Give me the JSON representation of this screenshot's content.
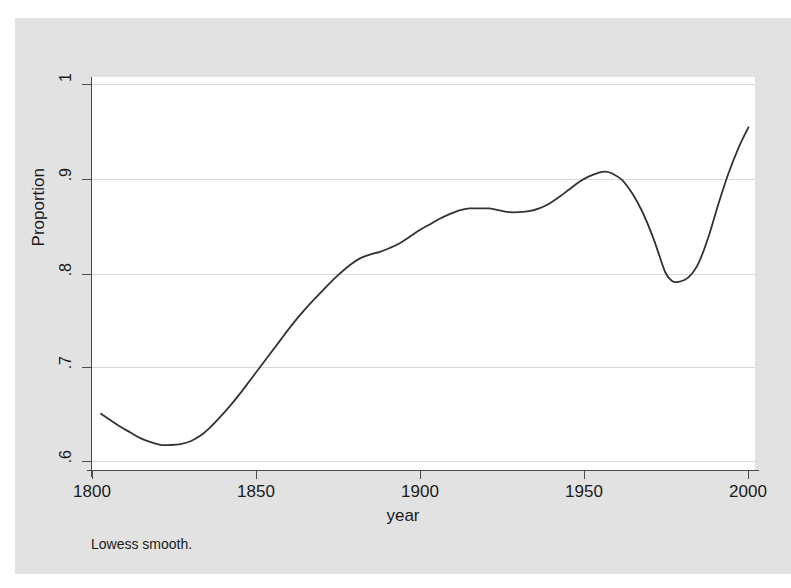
{
  "figure": {
    "background_color": "#e2e2e2",
    "plot_background_color": "#ffffff",
    "line_color": "#333333",
    "grid_color": "#d9d9d9",
    "axis_color": "#4a4a4a"
  },
  "labels": {
    "ylabel": "Proportion",
    "xlabel": "year",
    "note": "Lowess smooth."
  },
  "chart_data": {
    "type": "line",
    "title": "",
    "xlabel": "year",
    "ylabel": "Proportion",
    "note": "Lowess smooth.",
    "xlim": [
      1800,
      2000
    ],
    "ylim": [
      0.6,
      1.0
    ],
    "xticks": [
      1800,
      1850,
      1900,
      1950,
      2000
    ],
    "xtick_labels": [
      "1800",
      "1850",
      "1900",
      "1950",
      "2000"
    ],
    "yticks": [
      0.6,
      0.7,
      0.8,
      0.9,
      1.0
    ],
    "ytick_labels": [
      ".6",
      ".7",
      ".8",
      ".9",
      "1"
    ],
    "grid": "horizontal",
    "legend": "none",
    "series": [
      {
        "name": "Lowess smooth",
        "x": [
          1803,
          1806,
          1809,
          1812,
          1815,
          1818,
          1821,
          1824,
          1827,
          1830,
          1833,
          1836,
          1839,
          1842,
          1845,
          1848,
          1851,
          1854,
          1857,
          1860,
          1863,
          1866,
          1869,
          1872,
          1875,
          1878,
          1881,
          1884,
          1887,
          1890,
          1893,
          1896,
          1899,
          1902,
          1905,
          1908,
          1911,
          1914,
          1917,
          1920,
          1923,
          1926,
          1929,
          1932,
          1935,
          1938,
          1941,
          1944,
          1947,
          1950,
          1953,
          1955,
          1957,
          1960,
          1963,
          1966,
          1969,
          1971,
          1973,
          1975,
          1977,
          1980,
          1983,
          1986,
          1989,
          1992,
          1995,
          1998
        ],
        "y": [
          0.65,
          0.643,
          0.636,
          0.63,
          0.624,
          0.62,
          0.617,
          0.617,
          0.618,
          0.621,
          0.627,
          0.636,
          0.647,
          0.659,
          0.672,
          0.686,
          0.7,
          0.714,
          0.728,
          0.742,
          0.755,
          0.767,
          0.778,
          0.789,
          0.799,
          0.808,
          0.815,
          0.819,
          0.822,
          0.826,
          0.831,
          0.838,
          0.845,
          0.851,
          0.857,
          0.862,
          0.866,
          0.868,
          0.868,
          0.868,
          0.866,
          0.864,
          0.864,
          0.865,
          0.868,
          0.873,
          0.88,
          0.888,
          0.896,
          0.902,
          0.906,
          0.907,
          0.905,
          0.898,
          0.884,
          0.865,
          0.84,
          0.82,
          0.8,
          0.791,
          0.79,
          0.795,
          0.81,
          0.838,
          0.873,
          0.905,
          0.932,
          0.954
        ]
      }
    ]
  }
}
